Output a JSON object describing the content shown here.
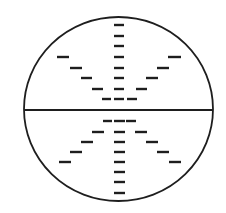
{
  "canvas": {
    "width": 226,
    "height": 213,
    "background": "#ffffff"
  },
  "stroke_color": "#1e1e1e",
  "circle": {
    "cx": 118.5,
    "cy": 109,
    "rx": 94.5,
    "ry": 92,
    "stroke_width": 1.8
  },
  "diameter": {
    "x1": 24,
    "x2": 213,
    "y": 110,
    "stroke_width": 2.2
  },
  "dash": {
    "thickness": 2.4
  },
  "dashes": {
    "upper_center": [
      {
        "x1": 114,
        "x2": 124,
        "y": 25
      },
      {
        "x1": 114,
        "x2": 124,
        "y": 36
      },
      {
        "x1": 114,
        "x2": 124,
        "y": 46
      },
      {
        "x1": 114,
        "x2": 124,
        "y": 57
      },
      {
        "x1": 114,
        "x2": 124,
        "y": 68
      },
      {
        "x1": 114,
        "x2": 124,
        "y": 78
      },
      {
        "x1": 114,
        "x2": 124,
        "y": 89
      },
      {
        "x1": 114,
        "x2": 124,
        "y": 99
      }
    ],
    "upper_left": [
      {
        "x1": 57,
        "x2": 69,
        "y": 57
      },
      {
        "x1": 70,
        "x2": 82,
        "y": 68
      },
      {
        "x1": 81,
        "x2": 92,
        "y": 78
      },
      {
        "x1": 92,
        "x2": 103,
        "y": 89
      },
      {
        "x1": 102,
        "x2": 111,
        "y": 99
      }
    ],
    "upper_right": [
      {
        "x1": 168,
        "x2": 181,
        "y": 57
      },
      {
        "x1": 157,
        "x2": 169,
        "y": 68
      },
      {
        "x1": 146,
        "x2": 158,
        "y": 78
      },
      {
        "x1": 136,
        "x2": 147,
        "y": 89
      },
      {
        "x1": 127,
        "x2": 137,
        "y": 99
      }
    ],
    "lower_center": [
      {
        "x1": 114,
        "x2": 125,
        "y": 121
      },
      {
        "x1": 114,
        "x2": 125,
        "y": 132
      },
      {
        "x1": 114,
        "x2": 125,
        "y": 142
      },
      {
        "x1": 114,
        "x2": 125,
        "y": 152
      },
      {
        "x1": 114,
        "x2": 125,
        "y": 162
      },
      {
        "x1": 114,
        "x2": 125,
        "y": 172
      },
      {
        "x1": 114,
        "x2": 125,
        "y": 182
      },
      {
        "x1": 114,
        "x2": 125,
        "y": 193
      }
    ],
    "lower_left": [
      {
        "x1": 103,
        "x2": 112,
        "y": 121
      },
      {
        "x1": 92,
        "x2": 104,
        "y": 132
      },
      {
        "x1": 81,
        "x2": 93,
        "y": 142
      },
      {
        "x1": 70,
        "x2": 82,
        "y": 152
      },
      {
        "x1": 59,
        "x2": 71,
        "y": 162
      }
    ],
    "lower_right": [
      {
        "x1": 126,
        "x2": 136,
        "y": 121
      },
      {
        "x1": 135,
        "x2": 147,
        "y": 132
      },
      {
        "x1": 146,
        "x2": 158,
        "y": 142
      },
      {
        "x1": 157,
        "x2": 169,
        "y": 152
      },
      {
        "x1": 169,
        "x2": 181,
        "y": 162
      }
    ]
  }
}
